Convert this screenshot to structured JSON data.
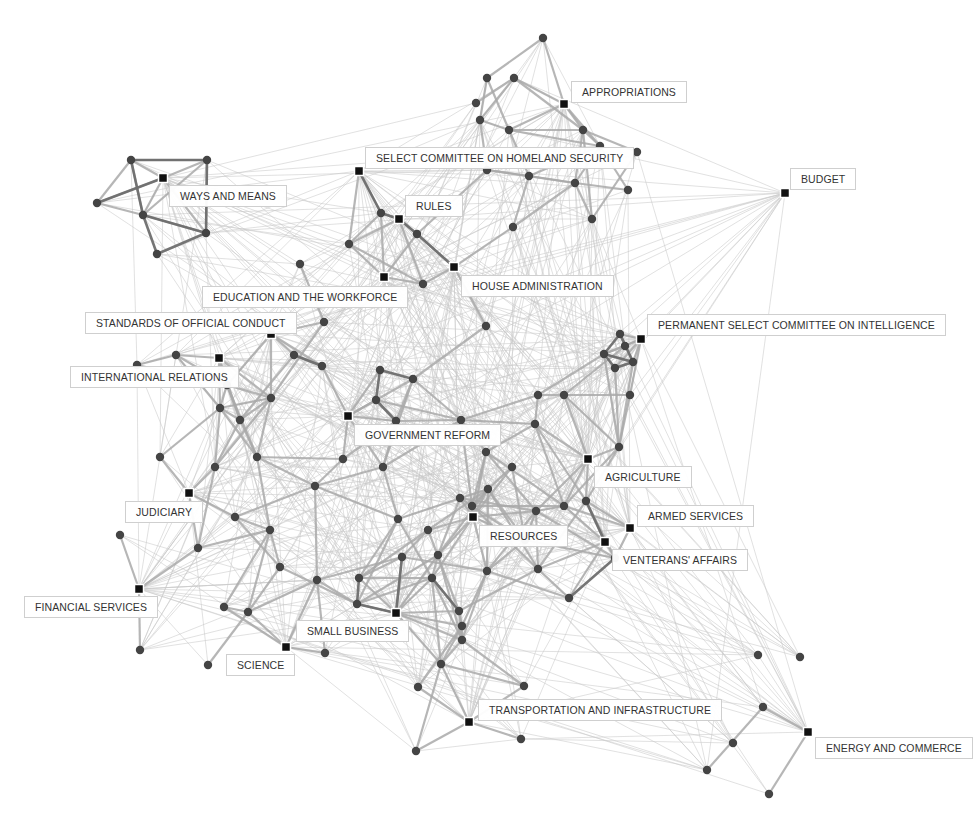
{
  "diagram": {
    "type": "network",
    "committees": [
      {
        "id": "appropriations",
        "label": "APPROPRIATIONS",
        "x": 564,
        "y": 104,
        "lx": 571,
        "ly": 81
      },
      {
        "id": "homeland",
        "label": "SELECT COMMITTEE ON HOMELAND SECURITY",
        "x": 359,
        "y": 171,
        "lx": 365,
        "ly": 147
      },
      {
        "id": "budget",
        "label": "BUDGET",
        "x": 785,
        "y": 193,
        "lx": 790,
        "ly": 168
      },
      {
        "id": "ways",
        "label": "WAYS AND MEANS",
        "x": 163,
        "y": 178,
        "lx": 169,
        "ly": 185
      },
      {
        "id": "rules",
        "label": "RULES",
        "x": 399,
        "y": 219,
        "lx": 405,
        "ly": 195
      },
      {
        "id": "house_admin",
        "label": "HOUSE ADMINISTRATION",
        "x": 454,
        "y": 267,
        "lx": 461,
        "ly": 275
      },
      {
        "id": "education",
        "label": "EDUCATION AND THE WORKFORCE",
        "x": 384,
        "y": 277,
        "lx": 202,
        "ly": 286
      },
      {
        "id": "standards",
        "label": "STANDARDS OF OFFICIAL CONDUCT",
        "x": 271,
        "y": 334,
        "lx": 85,
        "ly": 312
      },
      {
        "id": "intelligence",
        "label": "PERMANENT SELECT COMMITTEE ON INTELLIGENCE",
        "x": 641,
        "y": 339,
        "lx": 647,
        "ly": 314
      },
      {
        "id": "intl",
        "label": "INTERNATIONAL RELATIONS",
        "x": 219,
        "y": 358,
        "lx": 70,
        "ly": 366
      },
      {
        "id": "gov_reform",
        "label": "GOVERNMENT REFORM",
        "x": 348,
        "y": 416,
        "lx": 354,
        "ly": 424
      },
      {
        "id": "agriculture",
        "label": "AGRICULTURE",
        "x": 588,
        "y": 459,
        "lx": 594,
        "ly": 466
      },
      {
        "id": "judiciary",
        "label": "JUDICIARY",
        "x": 189,
        "y": 493,
        "lx": 125,
        "ly": 501
      },
      {
        "id": "armed",
        "label": "ARMED SERVICES",
        "x": 630,
        "y": 528,
        "lx": 637,
        "ly": 505
      },
      {
        "id": "resources",
        "label": "RESOURCES",
        "x": 473,
        "y": 517,
        "lx": 479,
        "ly": 525
      },
      {
        "id": "veterans",
        "label": "VENTERANS' AFFAIRS",
        "x": 605,
        "y": 542,
        "lx": 612,
        "ly": 549
      },
      {
        "id": "financial",
        "label": "FINANCIAL SERVICES",
        "x": 139,
        "y": 589,
        "lx": 24,
        "ly": 596
      },
      {
        "id": "small_biz",
        "label": "SMALL BUSINESS",
        "x": 396,
        "y": 613,
        "lx": 296,
        "ly": 620
      },
      {
        "id": "science",
        "label": "SCIENCE",
        "x": 286,
        "y": 647,
        "lx": 226,
        "ly": 654
      },
      {
        "id": "transport",
        "label": "TRANSPORTATION AND INFRASTRUCTURE",
        "x": 469,
        "y": 722,
        "lx": 478,
        "ly": 699
      },
      {
        "id": "energy",
        "label": "ENERGY AND COMMERCE",
        "x": 808,
        "y": 732,
        "lx": 815,
        "ly": 737
      }
    ]
  }
}
